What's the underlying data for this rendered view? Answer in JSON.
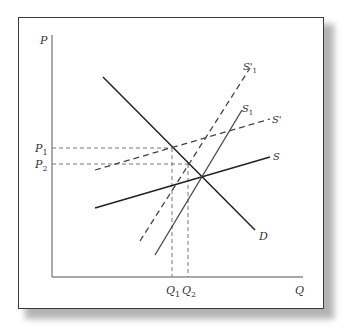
{
  "diagram": {
    "axes": {
      "y_label": "P",
      "x_label": "Q"
    },
    "curves": [
      {
        "id": "D",
        "label": "D",
        "style": "solid",
        "description": "Demand curve"
      },
      {
        "id": "S",
        "label": "S",
        "style": "solid",
        "description": "Supply (flat)"
      },
      {
        "id": "S_prime",
        "label": "S'",
        "style": "dashed",
        "description": "Shifted supply (flat)"
      },
      {
        "id": "S1",
        "label": "S",
        "label_sub": "1",
        "style": "solid",
        "description": "Supply (steep)"
      },
      {
        "id": "S1_prime",
        "label": "S'",
        "label_sub": "1",
        "style": "dashed",
        "description": "Shifted supply (steep)"
      }
    ],
    "price_marks": [
      {
        "label": "P",
        "sub": "1"
      },
      {
        "label": "P",
        "sub": "2"
      }
    ],
    "quantity_marks": [
      {
        "label": "Q",
        "sub": "1"
      },
      {
        "label": "Q",
        "sub": "2"
      }
    ]
  }
}
